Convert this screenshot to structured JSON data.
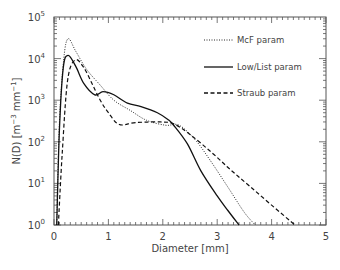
{
  "chart_data": {
    "type": "line",
    "title": "",
    "xlabel": "Diameter [mm]",
    "ylabel": "N(D) [m^-3 mm^-1]",
    "xlim": [
      0,
      5
    ],
    "ylim": [
      1,
      100000
    ],
    "yscale": "log",
    "x_ticks": [
      "0",
      "1",
      "2",
      "3",
      "4",
      "5"
    ],
    "y_ticks": [
      "10^0",
      "10^1",
      "10^2",
      "10^3",
      "10^4",
      "10^5"
    ],
    "grid": false,
    "legend_position": "upper right",
    "series": [
      {
        "name": "McF param",
        "style": "dotted",
        "points": [
          [
            0.05,
            1
          ],
          [
            0.1,
            300
          ],
          [
            0.18,
            10000
          ],
          [
            0.26,
            30000
          ],
          [
            0.4,
            15000
          ],
          [
            0.6,
            5500
          ],
          [
            0.85,
            2300
          ],
          [
            1.1,
            1000
          ],
          [
            1.4,
            570
          ],
          [
            1.7,
            330
          ],
          [
            2.05,
            250
          ],
          [
            2.3,
            250
          ],
          [
            2.6,
            110
          ],
          [
            2.87,
            36
          ],
          [
            3.2,
            8
          ],
          [
            3.5,
            2
          ],
          [
            3.7,
            1
          ]
        ]
      },
      {
        "name": "Low/List param",
        "style": "solid",
        "points": [
          [
            0.05,
            1
          ],
          [
            0.1,
            200
          ],
          [
            0.17,
            6000
          ],
          [
            0.26,
            12000
          ],
          [
            0.4,
            6500
          ],
          [
            0.55,
            2500
          ],
          [
            0.75,
            1350
          ],
          [
            0.9,
            1600
          ],
          [
            1.1,
            1350
          ],
          [
            1.35,
            850
          ],
          [
            1.6,
            700
          ],
          [
            1.9,
            500
          ],
          [
            2.1,
            340
          ],
          [
            2.2,
            250
          ],
          [
            2.45,
            90
          ],
          [
            2.7,
            20
          ],
          [
            3.0,
            5
          ],
          [
            3.2,
            2.2
          ],
          [
            3.4,
            1
          ]
        ]
      },
      {
        "name": "Straub param",
        "style": "dashed",
        "points": [
          [
            0.08,
            1
          ],
          [
            0.15,
            50
          ],
          [
            0.25,
            3000
          ],
          [
            0.39,
            9300
          ],
          [
            0.55,
            6000
          ],
          [
            0.7,
            2500
          ],
          [
            0.85,
            1000
          ],
          [
            1.0,
            500
          ],
          [
            1.2,
            260
          ],
          [
            1.5,
            290
          ],
          [
            1.95,
            300
          ],
          [
            2.2,
            270
          ],
          [
            2.5,
            150
          ],
          [
            2.9,
            55
          ],
          [
            3.25,
            21
          ],
          [
            3.6,
            8.5
          ],
          [
            4.0,
            3
          ],
          [
            4.43,
            1
          ]
        ]
      }
    ]
  },
  "legend": [
    {
      "label": "McF param",
      "style": "dotted"
    },
    {
      "label": "Low/List param",
      "style": "solid"
    },
    {
      "label": "Straub param",
      "style": "dashed"
    }
  ],
  "axes": {
    "xlabel": "Diameter [mm]",
    "ylabel_main": "N(D) [m",
    "ylabel_exp1": "−3",
    "ylabel_mid": " mm",
    "ylabel_exp2": "−1",
    "ylabel_end": "]",
    "x_ticks": [
      "0",
      "1",
      "2",
      "3",
      "4",
      "5"
    ],
    "y_ticks": [
      {
        "base": "10",
        "exp": "0"
      },
      {
        "base": "10",
        "exp": "1"
      },
      {
        "base": "10",
        "exp": "2"
      },
      {
        "base": "10",
        "exp": "3"
      },
      {
        "base": "10",
        "exp": "4"
      },
      {
        "base": "10",
        "exp": "5"
      }
    ]
  },
  "colors": {
    "line": "#111111",
    "axis": "#555555",
    "text": "#444444"
  }
}
